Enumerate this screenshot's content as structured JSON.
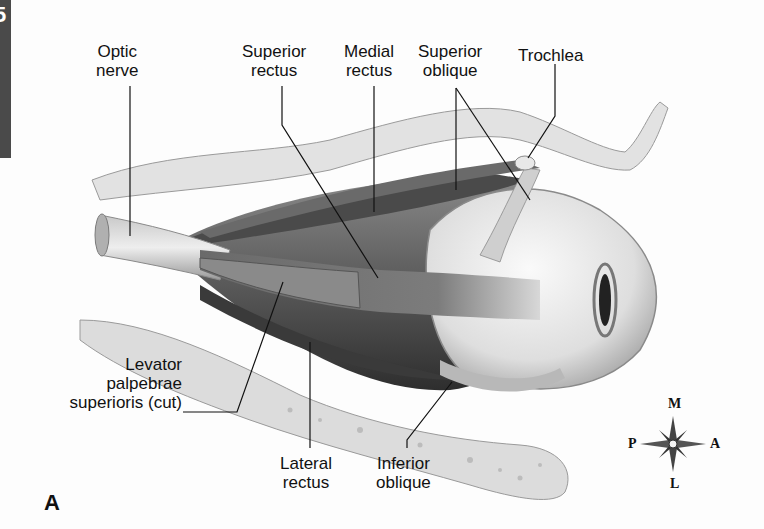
{
  "page": {
    "side_tab_glyph": "5",
    "panel_letter": "A"
  },
  "labels": {
    "optic_nerve": [
      "Optic",
      "nerve"
    ],
    "superior_rectus": [
      "Superior",
      "rectus"
    ],
    "medial_rectus": [
      "Medial",
      "rectus"
    ],
    "superior_oblique": [
      "Superior",
      "oblique"
    ],
    "trochlea": [
      "Trochlea"
    ],
    "levator": [
      "Levator",
      "palpebrae",
      "superioris (cut)"
    ],
    "lateral_rectus": [
      "Lateral",
      "rectus"
    ],
    "inferior_oblique": [
      "Inferior",
      "oblique"
    ]
  },
  "compass": {
    "north": "M",
    "south": "L",
    "west": "P",
    "east": "A"
  },
  "colors": {
    "ink": "#111111",
    "muscle_dark": "#3c3c3c",
    "muscle_mid": "#6e6e6e",
    "bone": "#d9d9d9",
    "eyeball": "#e9e9e9",
    "side_tab": "#4a4a4a"
  }
}
